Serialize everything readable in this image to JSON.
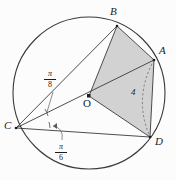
{
  "figure": {
    "type": "circle-geometry-diagram",
    "background_color": "#fcfcfc",
    "stroke_color": "#333333",
    "shade_color": "#d2d2d2",
    "points": [
      {
        "id": "A",
        "label": "A",
        "cx": 154,
        "cy": 60,
        "label_x": 159,
        "label_y": 50
      },
      {
        "id": "B",
        "label": "B",
        "cx": 117,
        "cy": 26,
        "label_x": 110,
        "label_y": 11
      },
      {
        "id": "C",
        "label": "C",
        "cx": 16,
        "cy": 128,
        "label_x": 5,
        "label_y": 126
      },
      {
        "id": "D",
        "label": "D",
        "cx": 150,
        "cy": 137,
        "label_x": 155,
        "label_y": 140
      },
      {
        "id": "O",
        "label": "O",
        "cx": 89,
        "cy": 96,
        "label_x": 83,
        "label_y": 100
      }
    ],
    "circle": {
      "cx": 89,
      "cy": 93,
      "r": 76
    },
    "angles": [
      {
        "id": "angle-bca",
        "numerator": "π",
        "denominator": "8",
        "label_x": 47,
        "label_y": 70,
        "vertex": "C",
        "between": [
          "CB",
          "CA"
        ]
      },
      {
        "id": "angle-acd",
        "numerator": "π",
        "denominator": "6",
        "label_x": 58,
        "label_y": 148,
        "vertex": "C",
        "between": [
          "CA",
          "CD"
        ]
      }
    ],
    "measurements": [
      {
        "id": "arc-ad-length",
        "value": "4",
        "label_x": 132,
        "label_y": 92,
        "refers_to": "dashed arc from A to D"
      }
    ],
    "shaded_region": {
      "id": "quad-badо",
      "vertices": [
        "B",
        "A",
        "D",
        "O"
      ],
      "fill": "#d2d2d2"
    },
    "segments": [
      {
        "from": "C",
        "to": "B"
      },
      {
        "from": "C",
        "to": "A"
      },
      {
        "from": "C",
        "to": "D"
      },
      {
        "from": "B",
        "to": "A"
      },
      {
        "from": "A",
        "to": "D"
      },
      {
        "from": "O",
        "to": "B"
      },
      {
        "from": "O",
        "to": "D"
      }
    ],
    "dashed_segments": [
      {
        "from": "A",
        "to": "D",
        "style": "curved-arc"
      }
    ]
  }
}
